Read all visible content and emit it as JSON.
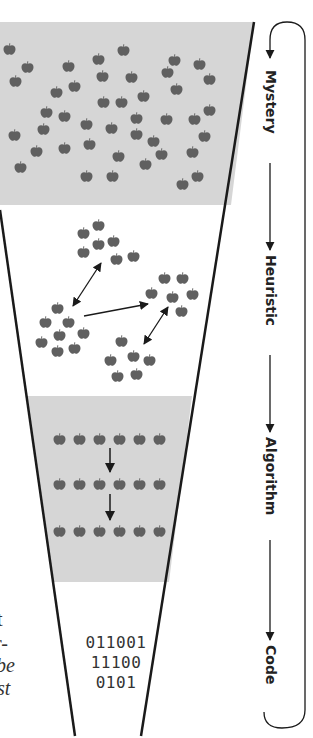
{
  "stages": [
    {
      "label": "Mystery"
    },
    {
      "label": "Heuristic"
    },
    {
      "label": "Algorithm"
    },
    {
      "label": "Code"
    }
  ],
  "code_block": {
    "lines": [
      "011001",
      "11100",
      "0101"
    ]
  },
  "left_text_fragments": [
    {
      "text": "t",
      "style": "normal"
    },
    {
      "text": "r-",
      "style": "normal"
    },
    {
      "text": "be",
      "style": "italic"
    },
    {
      "text": "st",
      "style": "italic"
    }
  ],
  "colors": {
    "band_gray": "#d6d6d6",
    "apple": "#606060",
    "line": "#1a1a1a",
    "text": "#222222"
  },
  "icons": {
    "apple": "apple-icon",
    "arrow": "arrow-icon",
    "loop": "loop-arrow-icon"
  }
}
